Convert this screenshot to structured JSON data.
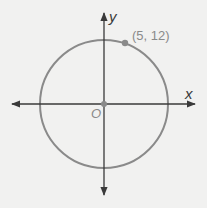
{
  "figure": {
    "type": "coordinate-plane-circle",
    "axes": {
      "x_label": "x",
      "y_label": "y",
      "origin_label": "O"
    },
    "circle": {
      "center": [
        0,
        0
      ],
      "radius": 13
    },
    "point": {
      "coords": [
        5,
        12
      ],
      "label": "(5, 12)"
    },
    "colors": {
      "background": "#f1f1f0",
      "axis": "#3a3a3a",
      "circle": "#8a8a8a",
      "point": "#8a8a8a",
      "text": "#3a3a3a"
    }
  }
}
